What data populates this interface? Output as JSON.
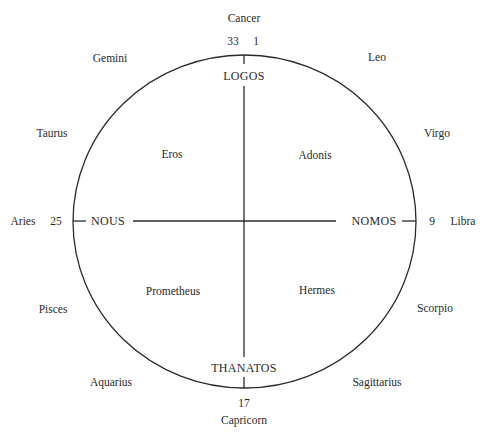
{
  "diagram": {
    "type": "circle-cross",
    "colors": {
      "ink": "#2a2a2a",
      "background": "#ffffff"
    },
    "axes": {
      "top": {
        "label": "LOGOS",
        "numbers": [
          "33",
          "1"
        ]
      },
      "bottom": {
        "label": "THANATOS",
        "number": "17"
      },
      "left": {
        "label": "NOUS",
        "number": "25"
      },
      "right": {
        "label": "NOMOS",
        "number": "9"
      }
    },
    "quadrants": {
      "upper_left": "Eros",
      "upper_right": "Adonis",
      "lower_left": "Prometheus",
      "lower_right": "Hermes"
    },
    "zodiac": {
      "cancer": "Cancer",
      "leo": "Leo",
      "virgo": "Virgo",
      "libra": "Libra",
      "scorpio": "Scorpio",
      "sagittarius": "Sagittarius",
      "capricorn": "Capricorn",
      "aquarius": "Aquarius",
      "pisces": "Pisces",
      "aries": "Aries",
      "taurus": "Taurus",
      "gemini": "Gemini"
    }
  }
}
